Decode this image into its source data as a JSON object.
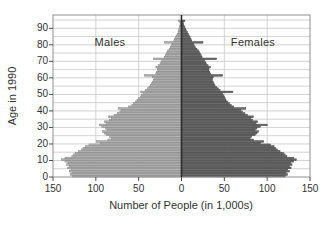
{
  "chart_data": {
    "type": "bar",
    "subtype": "population-pyramid",
    "title": "",
    "xlabel": "Number of People (in 1,000s)",
    "ylabel": "Age in 1990",
    "left_label": "Males",
    "right_label": "Females",
    "x_max": 150,
    "x_tick_values": [
      -150,
      -100,
      -50,
      0,
      50,
      100,
      150
    ],
    "x_tick_labels": [
      "150",
      "100",
      "50",
      "0",
      "50",
      "100",
      "150"
    ],
    "y_tick_step": 10,
    "y_tick_labels": [
      "0",
      "10",
      "20",
      "30",
      "40",
      "50",
      "60",
      "70",
      "80",
      "90"
    ],
    "grid_step_years": 5,
    "age_min": 0,
    "age_max": 94,
    "legend_position": "inside-top",
    "grid": true,
    "series": [
      {
        "name": "Males",
        "side": "left",
        "units": "thousands",
        "values": [
          127,
          130,
          128,
          131,
          129,
          133,
          131,
          134,
          132,
          136,
          140,
          136,
          128,
          126,
          124,
          120,
          117,
          115,
          112,
          108,
          95,
          99,
          86,
          82,
          84,
          88,
          90,
          92,
          87,
          89,
          93,
          96,
          88,
          90,
          84,
          82,
          85,
          78,
          75,
          72,
          70,
          74,
          62,
          58,
          56,
          54,
          52,
          50,
          48,
          47,
          45,
          48,
          42,
          40,
          38,
          36,
          35,
          34,
          33,
          32,
          34,
          43,
          30,
          29,
          28,
          28,
          30,
          27,
          25,
          24,
          23,
          33,
          20,
          19,
          18,
          17,
          16,
          14,
          13,
          12,
          11,
          20,
          9,
          8,
          7,
          6,
          5,
          4,
          3.5,
          3,
          2.5,
          2,
          1.5,
          2,
          4
        ]
      },
      {
        "name": "Females",
        "side": "right",
        "units": "thousands",
        "values": [
          121,
          124,
          122,
          126,
          124,
          128,
          126,
          129,
          127,
          131,
          134,
          131,
          123,
          121,
          119,
          115,
          112,
          110,
          108,
          104,
          92,
          96,
          84,
          80,
          82,
          86,
          88,
          90,
          86,
          88,
          92,
          100,
          87,
          89,
          83,
          81,
          84,
          77,
          74,
          71,
          69,
          75,
          61,
          58,
          56,
          54,
          52,
          51,
          50,
          49,
          48,
          60,
          45,
          43,
          41,
          39,
          38,
          37,
          36,
          36,
          37,
          48,
          34,
          33,
          32,
          32,
          34,
          31,
          29,
          28,
          27,
          41,
          24,
          23,
          22,
          21,
          20,
          18,
          16,
          15,
          14,
          25,
          12,
          11,
          10,
          9,
          8,
          7,
          6,
          5,
          4,
          3,
          2.5,
          2,
          4
        ]
      }
    ],
    "colors": {
      "male_fill": "#b2b2b2",
      "male_stroke": "#848484",
      "female_fill": "#6a6a6a",
      "female_stroke": "#454545",
      "grid": "#c7c7c7",
      "frame": "#8f8f8f",
      "center_line": "#2b2b2b",
      "tick": "#4a4a4a",
      "text": "#323232",
      "background": "#ffffff"
    }
  }
}
